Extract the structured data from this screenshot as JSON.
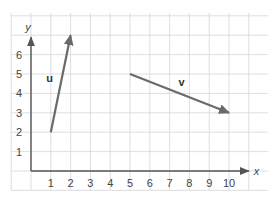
{
  "chart_data": {
    "type": "vector-diagram",
    "title": "",
    "xlabel": "x",
    "ylabel": "y",
    "xlim": [
      -1,
      12
    ],
    "ylim": [
      -1,
      8
    ],
    "x_ticks": [
      1,
      2,
      3,
      4,
      5,
      6,
      7,
      8,
      9,
      10
    ],
    "y_ticks": [
      1,
      2,
      3,
      4,
      5,
      6
    ],
    "grid": true,
    "vectors": [
      {
        "name": "u",
        "start": [
          1,
          2
        ],
        "end": [
          2,
          7
        ],
        "color": "#6a6a6a"
      },
      {
        "name": "v",
        "start": [
          5,
          5
        ],
        "end": [
          10,
          3
        ],
        "color": "#6a6a6a"
      }
    ]
  }
}
